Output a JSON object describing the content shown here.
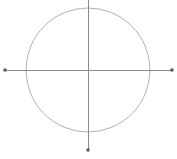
{
  "figure": {
    "width": 177,
    "height": 159,
    "background_color": "#ffffff"
  },
  "chart_data": {
    "type": "scatter",
    "title": "",
    "subtitle": "",
    "xlabel": "",
    "ylabel": "",
    "grid": false,
    "legend": null,
    "xlim": [
      0,
      177
    ],
    "ylim": [
      0,
      159
    ],
    "annotations": [],
    "tick_labels": {
      "x": [],
      "y": []
    },
    "shapes": [
      {
        "name": "circle",
        "kind": "circle",
        "cx": 88,
        "cy": 70,
        "r": 62,
        "stroke": "#b0b0b0",
        "stroke_width": 1,
        "fill": "none"
      },
      {
        "name": "horizontal-axis",
        "kind": "line",
        "x1": 5,
        "y1": 70,
        "x2": 172,
        "y2": 70,
        "stroke": "#8a8a8a",
        "stroke_width": 1
      },
      {
        "name": "vertical-axis",
        "kind": "line",
        "x1": 88,
        "y1": 0,
        "x2": 88,
        "y2": 150,
        "stroke": "#8a8a8a",
        "stroke_width": 1
      }
    ],
    "points": [
      {
        "name": "left-axis-endpoint",
        "x": 5,
        "y": 70,
        "marker": "square",
        "size": 3,
        "color": "#555555"
      },
      {
        "name": "right-axis-endpoint",
        "x": 172,
        "y": 70,
        "marker": "square",
        "size": 3,
        "color": "#555555"
      },
      {
        "name": "bottom-axis-endpoint",
        "x": 88,
        "y": 150,
        "marker": "square",
        "size": 3,
        "color": "#555555"
      }
    ],
    "colors": {
      "circle_stroke": "#b0b0b0",
      "axis_stroke": "#8a8a8a",
      "marker_fill": "#555555",
      "background": "#ffffff"
    }
  }
}
